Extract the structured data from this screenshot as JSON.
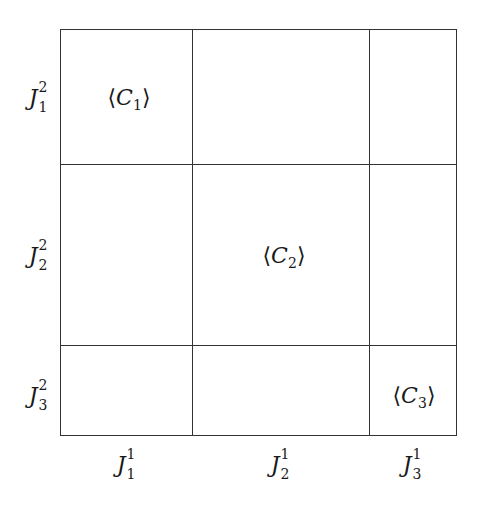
{
  "diagram": {
    "type": "block-partition-grid",
    "columns": [
      {
        "label": "J",
        "sup": "1",
        "sub": "1"
      },
      {
        "label": "J",
        "sup": "1",
        "sub": "2"
      },
      {
        "label": "J",
        "sup": "1",
        "sub": "3"
      }
    ],
    "rows": [
      {
        "label": "J",
        "sup": "2",
        "sub": "1"
      },
      {
        "label": "J",
        "sup": "2",
        "sub": "2"
      },
      {
        "label": "J",
        "sup": "2",
        "sub": "3"
      }
    ],
    "cells": [
      {
        "row": 1,
        "col": 1,
        "open": "⟨",
        "var": "C",
        "sub": "1",
        "close": "⟩"
      },
      {
        "row": 2,
        "col": 2,
        "open": "⟨",
        "var": "C",
        "sub": "2",
        "close": "⟩"
      },
      {
        "row": 3,
        "col": 3,
        "open": "⟨",
        "var": "C",
        "sub": "3",
        "close": "⟩"
      }
    ],
    "line_color": "#333333"
  }
}
